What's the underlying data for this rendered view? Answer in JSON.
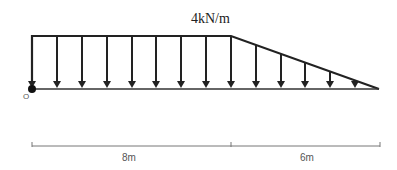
{
  "diagram": {
    "type": "distributed-load-beam",
    "load": {
      "label": "4kN/m",
      "magnitude": 4,
      "unit": "kN/m"
    },
    "origin": {
      "label": "O"
    },
    "segments": [
      {
        "label": "8m",
        "length": 8,
        "load_shape": "uniform"
      },
      {
        "label": "6m",
        "length": 6,
        "load_shape": "triangular-decreasing"
      }
    ],
    "colors": {
      "load": "#222222",
      "dimension": "#777777"
    }
  }
}
